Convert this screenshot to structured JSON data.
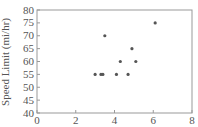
{
  "chart_data": {
    "type": "scatter",
    "title": "",
    "xlabel": "",
    "ylabel": "Speed Limit (mi/hr)",
    "xlim": [
      0,
      8
    ],
    "ylim": [
      40,
      80
    ],
    "xticks": [
      0,
      2,
      4,
      6,
      8
    ],
    "yticks": [
      40,
      45,
      50,
      55,
      60,
      65,
      70,
      75,
      80
    ],
    "grid": false,
    "legend": null,
    "series": [
      {
        "name": "points",
        "color": "#555555",
        "x": [
          3.0,
          3.3,
          3.4,
          3.5,
          4.1,
          4.3,
          4.7,
          4.9,
          5.1,
          6.1
        ],
        "y": [
          55,
          55,
          55,
          70,
          55,
          60,
          55,
          65,
          60,
          75
        ]
      }
    ]
  }
}
